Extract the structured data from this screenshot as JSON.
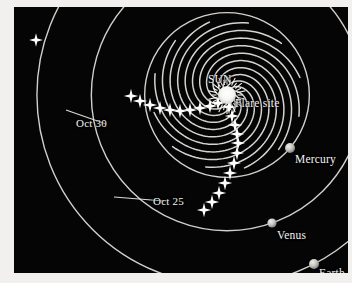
{
  "figure": {
    "kind": "heliospheric-particle-diagram",
    "background_color": "#050505",
    "page_color": "#f2f0ee",
    "line_color": "#e8e6e2",
    "label_color": "#f4f4f2"
  },
  "labels": {
    "sun": "SUN",
    "flare_site": "Flare site",
    "mercury": "Mercury",
    "venus": "Venus",
    "earth": "Earth",
    "oct30": "Oct 30",
    "oct25": "Oct 25"
  },
  "chart_data": {
    "type": "scatter",
    "title": "",
    "xlabel": "",
    "ylabel": "",
    "grid": false,
    "legend": false,
    "sun": {
      "x": 213,
      "y": 88,
      "radius": 9,
      "color": "#ffffff"
    },
    "flare_site": {
      "x": 218,
      "y": 92
    },
    "planets": [
      {
        "name": "Mercury",
        "x": 276,
        "y": 141,
        "radius": 5.0,
        "color": "#c9c7c2"
      },
      {
        "name": "Venus",
        "x": 258,
        "y": 216,
        "radius": 4.6,
        "color": "#c9c7c2"
      },
      {
        "name": "Earth",
        "x": 300,
        "y": 257,
        "radius": 5.0,
        "color": "#c9c7c2"
      }
    ],
    "date_annotations": [
      {
        "label": "Oct 30",
        "x": 62,
        "y": 110,
        "leader_from": [
          52,
          103
        ],
        "leader_to": [
          92,
          117
        ]
      },
      {
        "label": "Oct 25",
        "x": 139,
        "y": 188,
        "leader_from": [
          100,
          190
        ],
        "leader_to": [
          150,
          194
        ]
      }
    ],
    "spiral_field_lines": {
      "count": 12,
      "origin": [
        213,
        88
      ],
      "winding": "counterclockwise",
      "note": "Archimedean spirals r = a*(theta - theta0) emitted at evenly spaced source longitudes"
    },
    "particle_stream_oct30": {
      "points": [
        [
          204,
          96
        ],
        [
          196,
          99
        ],
        [
          186,
          101
        ],
        [
          176,
          103
        ],
        [
          166,
          104
        ],
        [
          156,
          103
        ],
        [
          146,
          101
        ],
        [
          136,
          98
        ],
        [
          126,
          94
        ],
        [
          117,
          89
        ]
      ]
    },
    "particle_stream_oct25": {
      "points": [
        [
          215,
          100
        ],
        [
          218,
          109
        ],
        [
          221,
          118
        ],
        [
          223,
          127
        ],
        [
          224,
          136
        ],
        [
          223,
          146
        ],
        [
          220,
          156
        ],
        [
          216,
          166
        ],
        [
          211,
          176
        ],
        [
          205,
          186
        ],
        [
          198,
          195
        ],
        [
          190,
          203
        ]
      ]
    },
    "field_star": {
      "x": 22,
      "y": 33
    },
    "star_marker": {
      "shape": "four-pointed-star",
      "color": "#ffffff"
    }
  }
}
